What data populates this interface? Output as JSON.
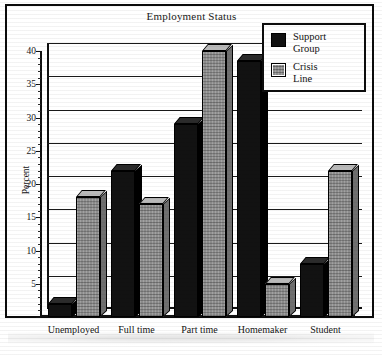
{
  "chart_data": {
    "type": "bar",
    "title": "Employment Status",
    "xlabel": "",
    "ylabel": "Percent",
    "categories": [
      "Unemployed",
      "Full time",
      "Part time",
      "Homemaker",
      "Student"
    ],
    "series": [
      {
        "name": "Support Group",
        "color": "#121212",
        "values": [
          2,
          22,
          29,
          38.5,
          8
        ]
      },
      {
        "name": "Crisis Line",
        "color": "#8e8e8e",
        "values": [
          18,
          17,
          40,
          5,
          22
        ]
      }
    ],
    "ylim": [
      0,
      40
    ],
    "yticks": [
      0,
      5,
      10,
      15,
      20,
      25,
      30,
      35,
      40
    ],
    "ytick_labels": [
      "",
      "5",
      "10",
      "15",
      "20",
      "25",
      "30",
      "35",
      "40"
    ],
    "grid": true,
    "legend_position": "top-right",
    "style": "3d-bar"
  },
  "legend": {
    "entries": [
      {
        "label_line1": "Support",
        "label_line2": "Group"
      },
      {
        "label_line1": "Crisis",
        "label_line2": "Line"
      }
    ]
  }
}
